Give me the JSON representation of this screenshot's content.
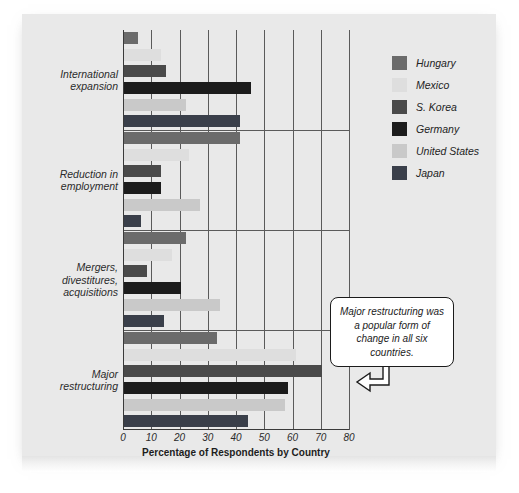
{
  "chart_data": {
    "type": "bar",
    "orientation": "horizontal",
    "title": "",
    "xlabel": "Percentage of Respondents by Country",
    "ylabel": "",
    "xlim": [
      0,
      80
    ],
    "xticks": [
      0,
      10,
      20,
      30,
      40,
      50,
      60,
      70,
      80
    ],
    "grid": true,
    "legend_position": "right",
    "categories": [
      "International expansion",
      "Reduction in employment",
      "Mergers, divestitures, acquisitions",
      "Major restructuring"
    ],
    "series": [
      {
        "name": "Hungary",
        "color": "#6b6b6b",
        "values": [
          5,
          41,
          22,
          33
        ]
      },
      {
        "name": "Mexico",
        "color": "#dedede",
        "values": [
          13,
          23,
          17,
          61
        ]
      },
      {
        "name": "S. Korea",
        "color": "#4a4a4a",
        "values": [
          15,
          13,
          8,
          70
        ]
      },
      {
        "name": "Germany",
        "color": "#1c1c1c",
        "values": [
          45,
          13,
          20,
          58
        ]
      },
      {
        "name": "United States",
        "color": "#c9c9c9",
        "values": [
          22,
          27,
          34,
          57
        ]
      },
      {
        "name": "Japan",
        "color": "#3a3f4a",
        "values": [
          41,
          6,
          14,
          44
        ]
      }
    ],
    "annotations": [
      {
        "text": "Major restructuring was a popular form of change in all six countries.",
        "points_to": "Major restructuring",
        "arrow": "left"
      }
    ]
  },
  "axis": {
    "xlabel": "Percentage of Respondents by Country",
    "tick_labels": [
      "0",
      "10",
      "20",
      "30",
      "40",
      "50",
      "60",
      "70",
      "80"
    ]
  },
  "categories": [
    {
      "line1": "International",
      "line2": "expansion",
      "line3": ""
    },
    {
      "line1": "Reduction in",
      "line2": "employment",
      "line3": ""
    },
    {
      "line1": "Mergers,",
      "line2": "divestitures,",
      "line3": "acquisitions"
    },
    {
      "line1": "Major",
      "line2": "restructuring",
      "line3": ""
    }
  ],
  "legend": {
    "items": [
      {
        "label": "Hungary",
        "color": "#6b6b6b"
      },
      {
        "label": "Mexico",
        "color": "#dedede"
      },
      {
        "label": "S. Korea",
        "color": "#4a4a4a"
      },
      {
        "label": "Germany",
        "color": "#1c1c1c"
      },
      {
        "label": "United States",
        "color": "#c9c9c9"
      },
      {
        "label": "Japan",
        "color": "#3a3f4a"
      }
    ]
  },
  "callout": {
    "text": "Major restructuring was a popular form of change in all six countries."
  }
}
